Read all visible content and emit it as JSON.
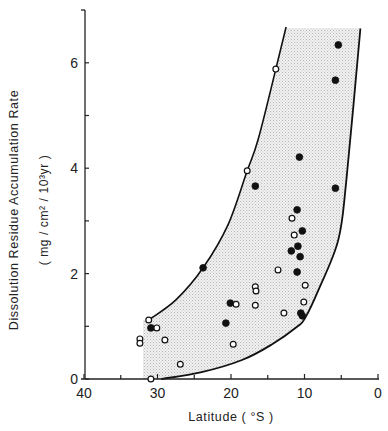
{
  "chart_data": {
    "type": "scatter",
    "title": "",
    "xlabel": "Latitude ( °S )",
    "ylabel": "Dissolution Residue Accumulation Rate",
    "ylabel_units": "( mg / cm² / 10³yr )",
    "xlim": [
      40,
      0
    ],
    "ylim": [
      0,
      7
    ],
    "x_ticks": [
      40,
      30,
      20,
      10,
      0
    ],
    "x_minor_ticks": [
      35,
      25,
      15,
      5
    ],
    "y_ticks": [
      0,
      2,
      4,
      6
    ],
    "y_minor_ticks": [
      1,
      3,
      5
    ],
    "x_tick_labels": [
      "40",
      "30",
      "20",
      "10",
      "0"
    ],
    "y_tick_labels": [
      "0",
      "2",
      "4",
      "6"
    ],
    "grid": false,
    "legend": null,
    "series": [
      {
        "name": "filled",
        "marker": "filled-circle",
        "points": [
          {
            "x": 5.4,
            "y": 6.34
          },
          {
            "x": 5.8,
            "y": 5.67
          },
          {
            "x": 10.7,
            "y": 4.21
          },
          {
            "x": 16.7,
            "y": 3.66
          },
          {
            "x": 5.8,
            "y": 3.62
          },
          {
            "x": 11.0,
            "y": 3.21
          },
          {
            "x": 10.3,
            "y": 2.81
          },
          {
            "x": 10.9,
            "y": 2.52
          },
          {
            "x": 11.8,
            "y": 2.43
          },
          {
            "x": 10.6,
            "y": 2.32
          },
          {
            "x": 23.8,
            "y": 2.11
          },
          {
            "x": 11.0,
            "y": 2.03
          },
          {
            "x": 20.1,
            "y": 1.44
          },
          {
            "x": 10.5,
            "y": 1.25
          },
          {
            "x": 10.3,
            "y": 1.2
          },
          {
            "x": 20.7,
            "y": 1.06
          },
          {
            "x": 30.9,
            "y": 0.97
          }
        ]
      },
      {
        "name": "open",
        "marker": "open-circle",
        "points": [
          {
            "x": 13.9,
            "y": 5.88
          },
          {
            "x": 17.8,
            "y": 3.95
          },
          {
            "x": 11.7,
            "y": 3.05
          },
          {
            "x": 11.4,
            "y": 2.73
          },
          {
            "x": 13.6,
            "y": 2.07
          },
          {
            "x": 9.9,
            "y": 1.78
          },
          {
            "x": 16.7,
            "y": 1.75
          },
          {
            "x": 16.6,
            "y": 1.67
          },
          {
            "x": 10.1,
            "y": 1.46
          },
          {
            "x": 19.3,
            "y": 1.42
          },
          {
            "x": 16.7,
            "y": 1.4
          },
          {
            "x": 12.8,
            "y": 1.25
          },
          {
            "x": 31.2,
            "y": 1.12
          },
          {
            "x": 30.1,
            "y": 0.97
          },
          {
            "x": 32.4,
            "y": 0.76
          },
          {
            "x": 29.0,
            "y": 0.74
          },
          {
            "x": 32.4,
            "y": 0.68
          },
          {
            "x": 19.7,
            "y": 0.66
          },
          {
            "x": 26.9,
            "y": 0.28
          },
          {
            "x": 30.9,
            "y": 0.0
          }
        ]
      }
    ],
    "envelope": {
      "description": "stippled shaded region bounded by two curves",
      "upper_left_curve": [
        [
          31.2,
          1.12
        ],
        [
          27.5,
          1.5
        ],
        [
          23.8,
          2.11
        ],
        [
          20.4,
          2.93
        ],
        [
          17.8,
          3.95
        ],
        [
          16.3,
          4.55
        ],
        [
          13.9,
          5.88
        ],
        [
          12.5,
          6.68
        ]
      ],
      "lower_right_curve": [
        [
          29.5,
          0.0
        ],
        [
          24.0,
          0.13
        ],
        [
          18.5,
          0.36
        ],
        [
          14.5,
          0.65
        ],
        [
          11.0,
          0.99
        ],
        [
          9.9,
          1.16
        ],
        [
          8.1,
          1.69
        ],
        [
          5.4,
          2.64
        ],
        [
          4.3,
          3.78
        ],
        [
          2.4,
          6.65
        ]
      ],
      "fill_color": "#e6e6e6"
    }
  }
}
